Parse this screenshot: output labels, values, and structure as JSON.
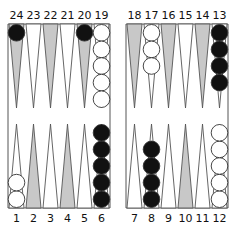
{
  "board": {
    "colors": {
      "background": "#ffffff",
      "line": "#555555",
      "shaded_point": "#c8c8c8",
      "light_point": "#ffffff",
      "black_checker": "#111111",
      "white_checker": "#ffffff",
      "checker_outline": "#333333"
    },
    "top_labels_left": [
      "24",
      "23",
      "22",
      "21",
      "20",
      "19"
    ],
    "top_labels_right": [
      "18",
      "17",
      "16",
      "15",
      "14",
      "13"
    ],
    "bottom_labels_left": [
      "1",
      "2",
      "3",
      "4",
      "5",
      "6"
    ],
    "bottom_labels_right": [
      "7",
      "8",
      "9",
      "10",
      "11",
      "12"
    ],
    "points": [
      {
        "point": 24,
        "shaded": true,
        "checkers": {
          "color": "black",
          "count": 1
        }
      },
      {
        "point": 23,
        "shaded": false,
        "checkers": {
          "color": "none",
          "count": 0
        }
      },
      {
        "point": 22,
        "shaded": true,
        "checkers": {
          "color": "none",
          "count": 0
        }
      },
      {
        "point": 21,
        "shaded": false,
        "checkers": {
          "color": "none",
          "count": 0
        }
      },
      {
        "point": 20,
        "shaded": true,
        "checkers": {
          "color": "black",
          "count": 1
        }
      },
      {
        "point": 19,
        "shaded": false,
        "checkers": {
          "color": "white",
          "count": 5
        }
      },
      {
        "point": 18,
        "shaded": true,
        "checkers": {
          "color": "none",
          "count": 0
        }
      },
      {
        "point": 17,
        "shaded": false,
        "checkers": {
          "color": "white",
          "count": 3
        }
      },
      {
        "point": 16,
        "shaded": true,
        "checkers": {
          "color": "none",
          "count": 0
        }
      },
      {
        "point": 15,
        "shaded": false,
        "checkers": {
          "color": "none",
          "count": 0
        }
      },
      {
        "point": 14,
        "shaded": true,
        "checkers": {
          "color": "none",
          "count": 0
        }
      },
      {
        "point": 13,
        "shaded": false,
        "checkers": {
          "color": "black",
          "count": 4
        }
      },
      {
        "point": 1,
        "shaded": false,
        "checkers": {
          "color": "white",
          "count": 2
        }
      },
      {
        "point": 2,
        "shaded": true,
        "checkers": {
          "color": "none",
          "count": 0
        }
      },
      {
        "point": 3,
        "shaded": false,
        "checkers": {
          "color": "none",
          "count": 0
        }
      },
      {
        "point": 4,
        "shaded": true,
        "checkers": {
          "color": "none",
          "count": 0
        }
      },
      {
        "point": 5,
        "shaded": false,
        "checkers": {
          "color": "none",
          "count": 0
        }
      },
      {
        "point": 6,
        "shaded": false,
        "checkers": {
          "color": "black",
          "count": 5
        }
      },
      {
        "point": 7,
        "shaded": false,
        "checkers": {
          "color": "none",
          "count": 0
        }
      },
      {
        "point": 8,
        "shaded": false,
        "checkers": {
          "color": "black",
          "count": 4
        }
      },
      {
        "point": 9,
        "shaded": false,
        "checkers": {
          "color": "none",
          "count": 0
        }
      },
      {
        "point": 10,
        "shaded": true,
        "checkers": {
          "color": "none",
          "count": 0
        }
      },
      {
        "point": 11,
        "shaded": false,
        "checkers": {
          "color": "none",
          "count": 0
        }
      },
      {
        "point": 12,
        "shaded": false,
        "checkers": {
          "color": "white",
          "count": 5
        }
      }
    ]
  }
}
